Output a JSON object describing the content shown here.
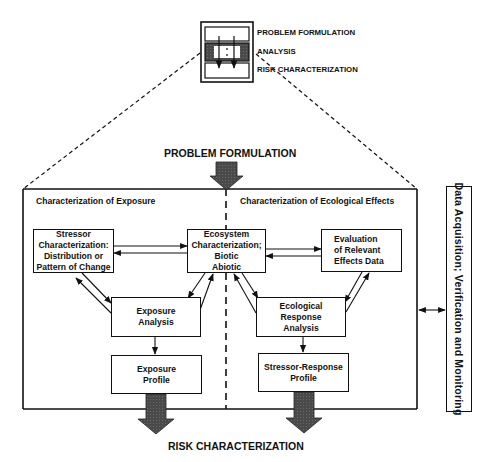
{
  "legend_icon": {
    "labels": [
      "PROBLEM FORMULATION",
      "ANALYSIS",
      "RISK CHARACTERIZATION"
    ]
  },
  "header": {
    "top_stage": "PROBLEM FORMULATION",
    "bottom_stage": "RISK CHARACTERIZATION"
  },
  "analysis_frame": {
    "left_title": "Characterization of Exposure",
    "right_title": "Characterization of Ecological Effects"
  },
  "boxes": {
    "stressor": [
      "Stressor",
      "Characterization:",
      "Distribution or",
      "Pattern of Change"
    ],
    "ecosystem": [
      "Ecosystem",
      "Characterization;",
      "Biotic",
      "Abiotic"
    ],
    "evaluation": [
      "Evaluation",
      "of Relevant",
      "Effects Data"
    ],
    "exposure_analysis": [
      "Exposure",
      "Analysis"
    ],
    "ecological_response": [
      "Ecological",
      "Response",
      "Analysis"
    ],
    "exposure_profile": [
      "Exposure",
      "Profile"
    ],
    "stressor_response_profile": [
      "Stressor-Response",
      "Profile"
    ]
  },
  "side_panel": {
    "label": "Data Acquisition; Verification and Monitoring"
  },
  "colors": {
    "line": "#111111",
    "block_arrow_fill": "#555555",
    "background": "#ffffff"
  }
}
